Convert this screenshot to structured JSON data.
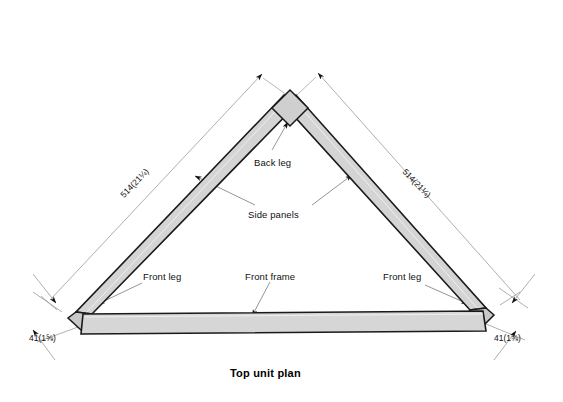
{
  "drawing": {
    "title": "Top unit plan",
    "type": "technical-plan-view",
    "units_note": "millimetres with inches in parentheses",
    "fill_color": "#d4d4d4",
    "frame_fill_color": "#d6d6d6",
    "line_color": "#1a1a1a",
    "dimension_line_color": "#8c8c8c",
    "background_color": "#ffffff"
  },
  "labels": {
    "back_leg": "Back leg",
    "side_panels": "Side panels",
    "front_leg_left": "Front leg",
    "front_frame": "Front frame",
    "front_leg_right": "Front leg"
  },
  "dimensions": {
    "left_side": {
      "value_mm": "514",
      "value_in": "(21¼)",
      "text": "514(21¼)"
    },
    "right_side": {
      "value_mm": "514",
      "value_in": "(21¼)",
      "text": "514(21¼)"
    },
    "left_leg_thickness": {
      "value_mm": "41",
      "value_in": "(1⅝)",
      "text": "41(1⅝)"
    },
    "right_leg_thickness": {
      "value_mm": "41",
      "value_in": "(1⅝)",
      "text": "41(1⅝)"
    }
  },
  "parts": [
    {
      "name": "back-leg",
      "shape": "block-at-apex"
    },
    {
      "name": "side-panel-left",
      "shape": "angled-bar"
    },
    {
      "name": "side-panel-right",
      "shape": "angled-bar"
    },
    {
      "name": "front-leg-left",
      "shape": "corner-block"
    },
    {
      "name": "front-leg-right",
      "shape": "corner-block"
    },
    {
      "name": "front-frame",
      "shape": "horizontal-bar"
    }
  ]
}
